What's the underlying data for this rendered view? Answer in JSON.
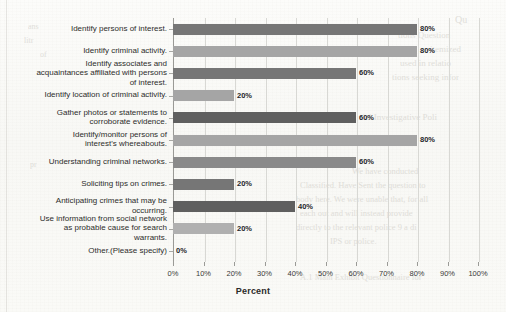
{
  "chart_data": {
    "type": "bar",
    "orientation": "horizontal",
    "title": "",
    "xlabel": "Percent",
    "ylabel": "",
    "xlim": [
      0,
      100
    ],
    "xticks": [
      "0%",
      "10%",
      "20%",
      "30%",
      "40%",
      "50%",
      "60%",
      "70%",
      "80%",
      "90%",
      "100%"
    ],
    "xtick_values": [
      0,
      10,
      20,
      30,
      40,
      50,
      60,
      70,
      80,
      90,
      100
    ],
    "grid": "vertical",
    "legend": "none",
    "categories": [
      "Identify persons of interest.",
      "Identify criminal activity.",
      "Identify associates and\nacquaintances affiliated with persons\nof interest.",
      "Identify location of criminal activity.",
      "Gather photos or statements to\ncorroborate evidence.",
      "Identify/monitor persons of\ninterest's whereabouts.",
      "Understanding criminal networks.",
      "Soliciting tips on crimes.",
      "Anticipating crimes that may be\noccurring.",
      "Use information from social network\nas probable cause for search\nwarrants.",
      "Other.(Please specify)"
    ],
    "values": [
      80,
      80,
      60,
      20,
      60,
      80,
      60,
      20,
      40,
      20,
      0
    ],
    "value_labels": [
      "80%",
      "80%",
      "60%",
      "20%",
      "60%",
      "80%",
      "60%",
      "20%",
      "40%",
      "20%",
      "0%"
    ],
    "bar_colors": [
      "#767676",
      "#a5a5a5",
      "#767676",
      "#a5a5a5",
      "#5f5f5f",
      "#a5a5a5",
      "#8a8a8a",
      "#767676",
      "#5f5f5f",
      "#b0b0b0",
      "#767676"
    ]
  },
  "background_text": {
    "right_column": [
      "Qu",
      "tions Question",
      "itemized",
      "used in relatio",
      "tions seeking infor",
      "",
      "tial Investigative Poli",
      "",
      "",
      "We have conducted",
      "Classified. Have Sent the question to",
      "body here. We were unable that, for all",
      "each out and will instead provide",
      "directly to the relevant police 9 a di",
      "IPS or police."
    ],
    "bottom_caption": "A.1   Main Exhibit Questionnaire for"
  }
}
